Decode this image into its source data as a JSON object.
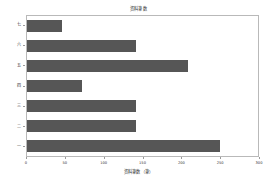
{
  "chart_data": {
    "type": "bar",
    "orientation": "horizontal",
    "title": "资料筆数",
    "xlabel": "资料筆数（筆）",
    "ylabel": "",
    "categories": [
      "七",
      "六",
      "五",
      "四",
      "三",
      "二",
      "一"
    ],
    "values": [
      45,
      142,
      209,
      71,
      142,
      142,
      251
    ],
    "xlim": [
      0,
      300
    ],
    "xticks": [
      0,
      50,
      100,
      150,
      200,
      250,
      300
    ],
    "xtick_labels": [
      "0",
      "50",
      "100",
      "150",
      "200",
      "250",
      "300"
    ],
    "grid": false,
    "legend": null,
    "bar_color": "#565656",
    "axes_color": "#b9b9b9",
    "background": "#ffffff"
  }
}
